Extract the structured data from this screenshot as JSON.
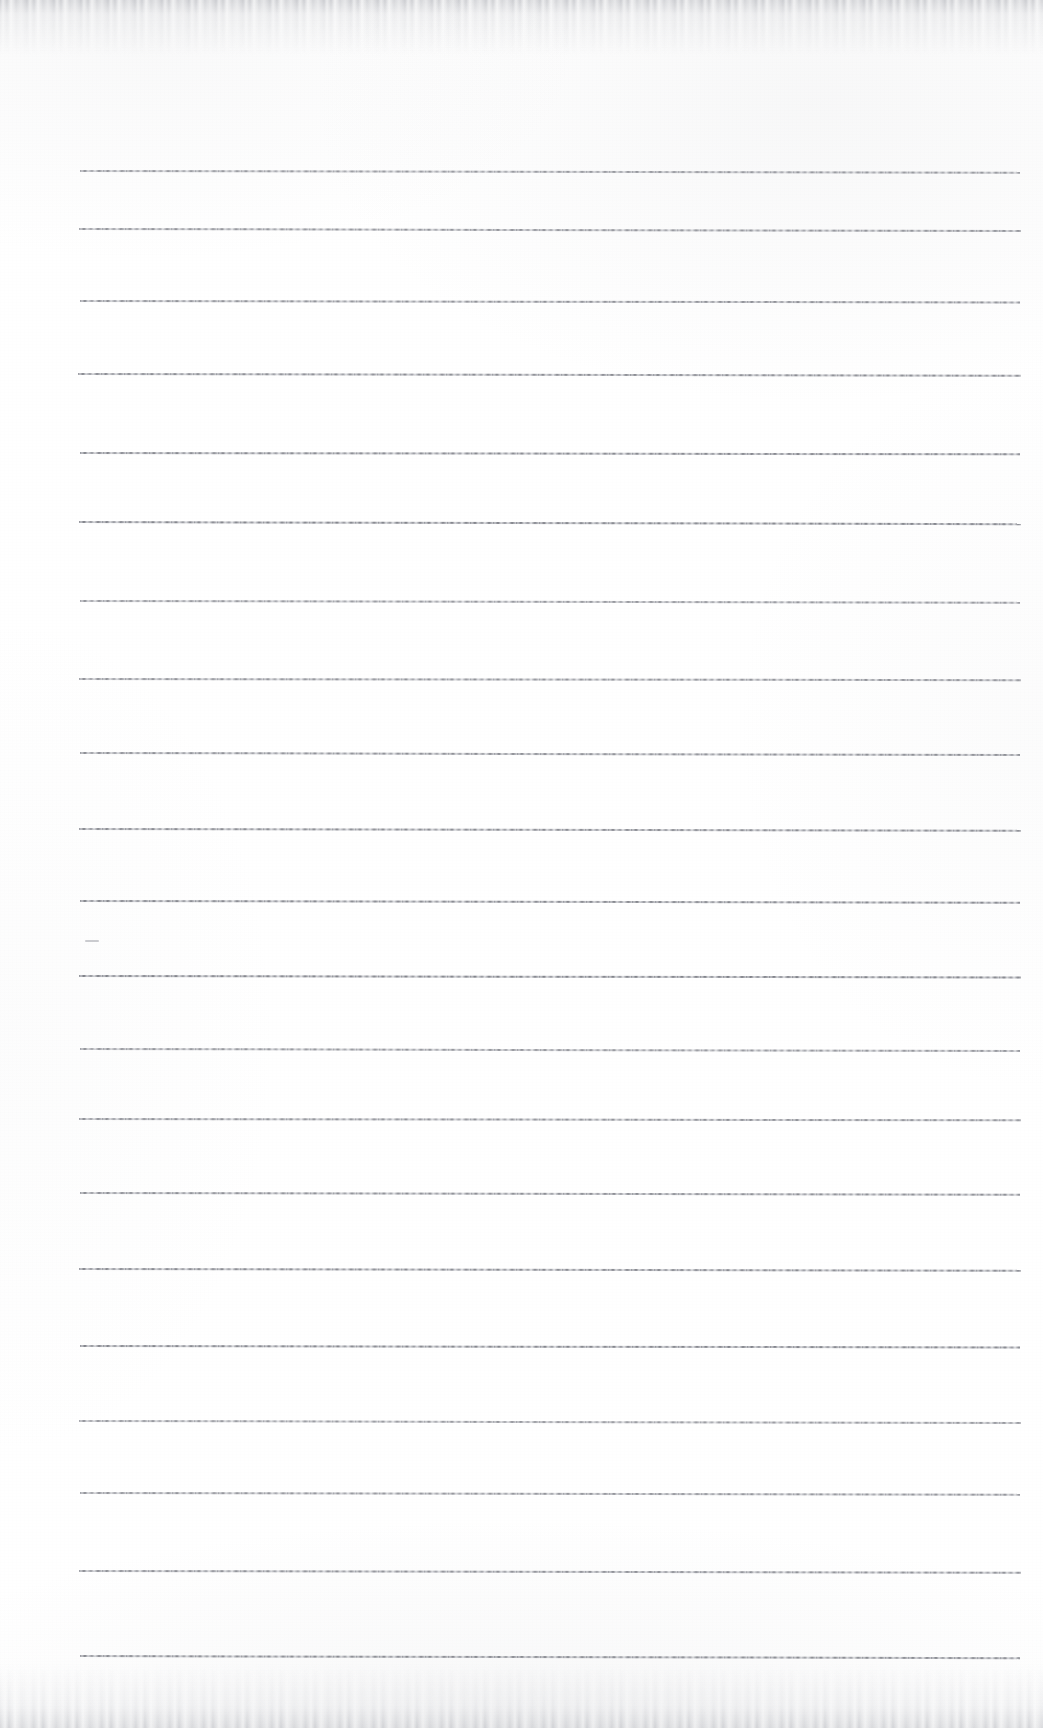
{
  "document": {
    "kind": "scanned-lined-notebook-page",
    "title": "Blank Ruled Page",
    "content_text": "",
    "page_width": 1043,
    "page_height": 1728,
    "background_color": "#ffffff",
    "rule_color": "#7a7c84",
    "edge_shadow_color": "#a3a5ac"
  },
  "ruling": {
    "line_count": 19,
    "left_x": 80,
    "right_x": 1021,
    "spacing": 82.4,
    "first_line_y": 170,
    "thickness_px": 1.6,
    "lines": [
      {
        "y": 170,
        "x_start": 80,
        "x_end": 1020,
        "slope_deg": 0.1
      },
      {
        "y": 228,
        "x_start": 79,
        "x_end": 1021,
        "slope_deg": 0.12
      },
      {
        "y": 300,
        "x_start": 80,
        "x_end": 1020,
        "slope_deg": 0.09
      },
      {
        "y": 373,
        "x_start": 78,
        "x_end": 1021,
        "slope_deg": 0.11
      },
      {
        "y": 452,
        "x_start": 80,
        "x_end": 1020,
        "slope_deg": 0.08
      },
      {
        "y": 521,
        "x_start": 79,
        "x_end": 1021,
        "slope_deg": 0.13
      },
      {
        "y": 600,
        "x_start": 80,
        "x_end": 1020,
        "slope_deg": 0.1
      },
      {
        "y": 678,
        "x_start": 79,
        "x_end": 1021,
        "slope_deg": 0.07
      },
      {
        "y": 752,
        "x_start": 80,
        "x_end": 1020,
        "slope_deg": 0.12
      },
      {
        "y": 828,
        "x_start": 79,
        "x_end": 1021,
        "slope_deg": 0.1
      },
      {
        "y": 900,
        "x_start": 80,
        "x_end": 1020,
        "slope_deg": 0.11
      },
      {
        "y": 975,
        "x_start": 79,
        "x_end": 1021,
        "slope_deg": 0.09
      },
      {
        "y": 1048,
        "x_start": 80,
        "x_end": 1020,
        "slope_deg": 0.12
      },
      {
        "y": 1118,
        "x_start": 79,
        "x_end": 1021,
        "slope_deg": 0.08
      },
      {
        "y": 1192,
        "x_start": 80,
        "x_end": 1020,
        "slope_deg": 0.11
      },
      {
        "y": 1268,
        "x_start": 79,
        "x_end": 1021,
        "slope_deg": 0.1
      },
      {
        "y": 1345,
        "x_start": 80,
        "x_end": 1020,
        "slope_deg": 0.09
      },
      {
        "y": 1420,
        "x_start": 79,
        "x_end": 1021,
        "slope_deg": 0.12
      },
      {
        "y": 1492,
        "x_start": 80,
        "x_end": 1020,
        "slope_deg": 0.1
      },
      {
        "y": 1570,
        "x_start": 79,
        "x_end": 1021,
        "slope_deg": 0.11
      },
      {
        "y": 1655,
        "x_start": 80,
        "x_end": 1020,
        "slope_deg": 0.13
      }
    ]
  },
  "marks": [
    {
      "name": "faint-pencil-tick",
      "x": 85,
      "y": 940,
      "width": 14,
      "height": 2
    }
  ],
  "artifacts": {
    "top_edge_label": "scan-edge-top",
    "bottom_edge_label": "scan-edge-bottom",
    "grain_label": "paper-grain"
  }
}
